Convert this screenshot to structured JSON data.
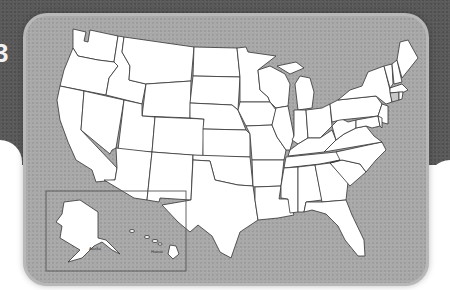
{
  "map": {
    "title": "Outline map of the United States",
    "inset": {
      "labels": {
        "alaska": "Alaska",
        "hawaii": "Hawaii"
      }
    },
    "shaded_states": [
      "Connecticut"
    ],
    "side_glyph": "3",
    "colors": {
      "backdrop": "#5a5a5a",
      "card": "#a9a9a9",
      "state_fill": "#ffffff",
      "state_stroke": "#333333",
      "shaded_fill": "#c8c8c8"
    }
  }
}
